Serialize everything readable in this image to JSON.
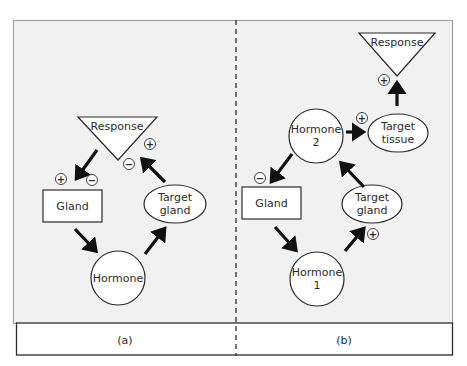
{
  "colors": {
    "panel_bg": "#f1f1f1",
    "caption_bg": "#ffffff",
    "stroke": "#2b2b2b",
    "arrow": "#111111",
    "node_fill": "#ffffff"
  },
  "panels": [
    {
      "id": "a",
      "caption": "(a)",
      "nodes": {
        "response": "Response",
        "gland": "Gland",
        "target_gland": [
          "Target",
          "gland"
        ],
        "hormone": "Hormone"
      },
      "signs": {
        "response_plus": "+",
        "response_minus": "−",
        "gland_plus": "+",
        "gland_minus": "−"
      },
      "edges": [
        {
          "from": "Response",
          "to": "Gland",
          "signs": [
            "+",
            "−"
          ]
        },
        {
          "from": "Gland",
          "to": "Hormone"
        },
        {
          "from": "Hormone",
          "to": "Target gland"
        },
        {
          "from": "Target gland",
          "to": "Response",
          "signs": [
            "+",
            "−"
          ]
        }
      ]
    },
    {
      "id": "b",
      "caption": "(b)",
      "nodes": {
        "response": "Response",
        "hormone2": [
          "Hormone",
          "2"
        ],
        "target_tissue": [
          "Target",
          "tissue"
        ],
        "gland": "Gland",
        "target_gland": [
          "Target",
          "gland"
        ],
        "hormone1": [
          "Hormone",
          "1"
        ]
      },
      "signs": {
        "response_plus": "+",
        "tissue_plus": "+",
        "gland_minus": "−",
        "target_gland_plus": "+"
      },
      "edges": [
        {
          "from": "Hormone 2",
          "to": "Target tissue",
          "signs": [
            "+"
          ]
        },
        {
          "from": "Target tissue",
          "to": "Response",
          "signs": [
            "+"
          ]
        },
        {
          "from": "Hormone 2",
          "to": "Gland",
          "signs": [
            "−"
          ]
        },
        {
          "from": "Gland",
          "to": "Hormone 1"
        },
        {
          "from": "Hormone 1",
          "to": "Target gland",
          "signs": [
            "+"
          ]
        },
        {
          "from": "Target gland",
          "to": "Hormone 2"
        }
      ]
    }
  ]
}
